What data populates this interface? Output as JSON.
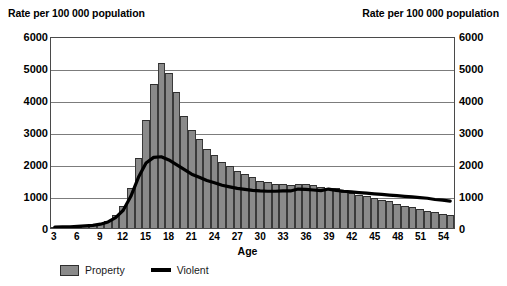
{
  "chart_data": {
    "type": "bar",
    "title": "",
    "left_axis_title": "Rate per 100 000 population",
    "right_axis_title": "Rate per 100 000 population",
    "xlabel": "Age",
    "ylabel": "Rate per 100 000 population",
    "ylim": [
      0,
      6000
    ],
    "ytick_values": [
      6000,
      5000,
      4000,
      3000,
      2000,
      1000,
      0
    ],
    "ytick_labels": [
      "6000",
      "5000",
      "4000",
      "3000",
      "2000",
      "1000",
      "0"
    ],
    "xtick_labels": [
      "3",
      "6",
      "9",
      "12",
      "15",
      "18",
      "21",
      "24",
      "27",
      "30",
      "33",
      "36",
      "39",
      "42",
      "45",
      "48",
      "51",
      "54"
    ],
    "grid": true,
    "legend_position": "bottom-left",
    "categories": [
      3,
      4,
      5,
      6,
      7,
      8,
      9,
      10,
      11,
      12,
      13,
      14,
      15,
      16,
      17,
      18,
      19,
      20,
      21,
      22,
      23,
      24,
      25,
      26,
      27,
      28,
      29,
      30,
      31,
      32,
      33,
      34,
      35,
      36,
      37,
      38,
      39,
      40,
      41,
      42,
      43,
      44,
      45,
      46,
      47,
      48,
      49,
      50,
      51,
      52,
      53,
      54,
      55
    ],
    "series": [
      {
        "name": "Property",
        "type": "bar",
        "color": "#8a8a8a",
        "values": [
          20,
          25,
          30,
          40,
          60,
          90,
          140,
          220,
          400,
          700,
          1250,
          2200,
          3400,
          4550,
          5200,
          4900,
          4300,
          3550,
          3100,
          2800,
          2500,
          2300,
          2100,
          1950,
          1800,
          1700,
          1600,
          1500,
          1450,
          1400,
          1380,
          1350,
          1400,
          1400,
          1350,
          1300,
          1250,
          1250,
          1150,
          1100,
          1050,
          1000,
          950,
          900,
          850,
          750,
          700,
          650,
          600,
          550,
          500,
          450,
          400
        ]
      },
      {
        "name": "Violent",
        "type": "line",
        "color": "#000000",
        "values": [
          30,
          35,
          40,
          50,
          65,
          85,
          120,
          190,
          330,
          560,
          1000,
          1600,
          2050,
          2230,
          2250,
          2150,
          2000,
          1850,
          1700,
          1600,
          1500,
          1430,
          1350,
          1300,
          1250,
          1220,
          1190,
          1170,
          1160,
          1160,
          1170,
          1170,
          1230,
          1220,
          1200,
          1180,
          1230,
          1190,
          1160,
          1140,
          1120,
          1100,
          1080,
          1060,
          1040,
          1020,
          1000,
          980,
          960,
          940,
          900,
          880,
          850
        ]
      }
    ]
  },
  "legend": {
    "items": [
      {
        "label": "Property",
        "marker": "bar-swatch"
      },
      {
        "label": "Violent",
        "marker": "line-swatch"
      }
    ]
  }
}
